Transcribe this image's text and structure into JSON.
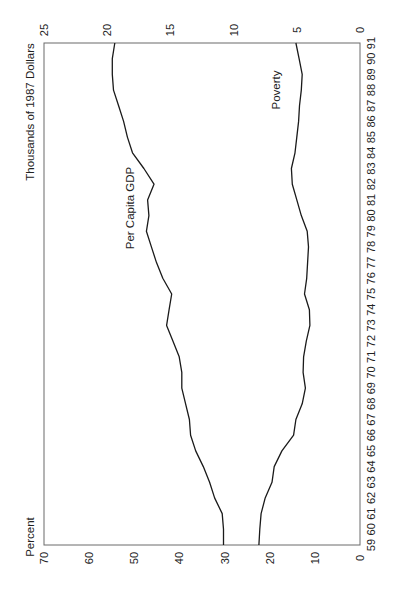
{
  "chart_data": {
    "type": "line",
    "orientation": "rotated-90-clockwise",
    "title": "",
    "x": [
      "59",
      "60",
      "61",
      "62",
      "63",
      "64",
      "65",
      "66",
      "67",
      "68",
      "69",
      "70",
      "71",
      "72",
      "73",
      "74",
      "75",
      "76",
      "77",
      "78",
      "79",
      "80",
      "81",
      "82",
      "83",
      "84",
      "85",
      "86",
      "87",
      "88",
      "89",
      "90",
      "91"
    ],
    "xlabel": "",
    "ylabel_left": "Percent",
    "ylabel_right": "Thousands of 1987 Dollars",
    "ylim_left": [
      0,
      70
    ],
    "ylim_right": [
      0,
      25
    ],
    "yticks_left": [
      0,
      10,
      20,
      30,
      40,
      50,
      60,
      70
    ],
    "yticks_right": [
      0,
      5,
      10,
      15,
      20,
      25
    ],
    "grid": false,
    "legend": "inline labels",
    "series": [
      {
        "name": "Per Capita GDP",
        "axis": "right",
        "unit": "Thousands of 1987 Dollars",
        "values": [
          10.8,
          10.8,
          10.9,
          11.5,
          11.9,
          12.4,
          13.0,
          13.4,
          13.5,
          13.8,
          14.1,
          14.1,
          14.3,
          14.8,
          15.3,
          15.1,
          14.9,
          15.6,
          16.1,
          16.5,
          16.9,
          16.7,
          16.8,
          16.3,
          17.1,
          18.0,
          18.4,
          18.7,
          19.1,
          19.5,
          19.6,
          19.6,
          19.4
        ]
      },
      {
        "name": "Poverty",
        "axis": "left",
        "unit": "Percent",
        "values": [
          22.4,
          22.2,
          21.9,
          21.0,
          19.5,
          19.0,
          17.3,
          14.7,
          14.2,
          12.8,
          12.1,
          12.6,
          12.5,
          11.9,
          11.1,
          11.2,
          12.3,
          11.8,
          11.6,
          11.4,
          11.7,
          13.0,
          14.0,
          15.0,
          15.2,
          14.4,
          14.0,
          13.6,
          13.4,
          13.0,
          12.8,
          13.5,
          14.2
        ]
      }
    ],
    "annotations": [
      {
        "text": "Per Capita GDP",
        "series": "Per Capita GDP"
      },
      {
        "text": "Poverty",
        "series": "Poverty"
      }
    ]
  },
  "labels": {
    "left_axis_title": "Percent",
    "right_axis_title": "Thousands of 1987 Dollars",
    "gdp_label": "Per Capita GDP",
    "poverty_label": "Poverty"
  }
}
